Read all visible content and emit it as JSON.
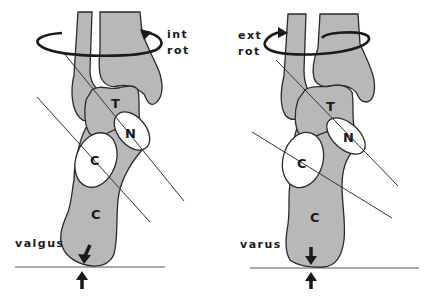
{
  "figure": {
    "panels": [
      {
        "id": "left",
        "rotation_label_line1": "int",
        "rotation_label_line2": "rot",
        "deformity_label": "valgus",
        "bone_labels": {
          "talus": "T",
          "navicular": "N",
          "cuboid": "C",
          "calcaneus": "C"
        }
      },
      {
        "id": "right",
        "rotation_label_line1": "ext",
        "rotation_label_line2": "rot",
        "deformity_label": "varus",
        "bone_labels": {
          "talus": "T",
          "navicular": "N",
          "cuboid": "C",
          "calcaneus": "C"
        }
      }
    ],
    "colors": {
      "bone_fill": "#b8b8b8",
      "outline": "#2a2a2a",
      "background": "#ffffff"
    }
  }
}
